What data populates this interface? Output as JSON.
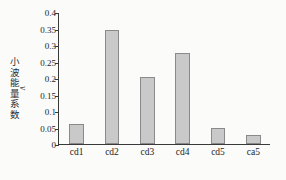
{
  "chart_data": {
    "type": "bar",
    "title": "",
    "xlabel": "",
    "ylabel": "小波能量系数",
    "ylabel_variable": "v",
    "categories": [
      "cd1",
      "cd2",
      "cd3",
      "cd4",
      "cd5",
      "ca5"
    ],
    "values": [
      0.061,
      0.348,
      0.206,
      0.278,
      0.05,
      0.027
    ],
    "ylim": [
      0,
      0.4
    ],
    "ytick_labels": [
      "0",
      "0.05",
      "0.1",
      "0.15",
      "0.2",
      "0.25",
      "0.3",
      "0.35",
      "0.4"
    ],
    "ytick_values": [
      0,
      0.05,
      0.1,
      0.15,
      0.2,
      0.25,
      0.3,
      0.35,
      0.4
    ],
    "grid": false,
    "legend": null,
    "bar_fill_color": "#c9c9c9",
    "bar_edge_color": "#8a8a8a",
    "axis_color": "#3a3a3a",
    "background_color": "#fbfbfa"
  }
}
